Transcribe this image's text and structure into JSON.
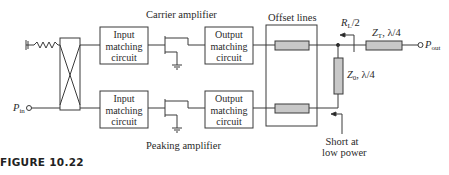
{
  "figure": {
    "caption": "FIGURE 10.22"
  },
  "blocks": {
    "input_matching_top": [
      "Input",
      "matching",
      "circuit"
    ],
    "input_matching_bottom": [
      "Input",
      "matching",
      "circuit"
    ],
    "output_matching_top": [
      "Output",
      "matching",
      "circuit"
    ],
    "output_matching_bottom": [
      "Output",
      "matching",
      "circuit"
    ]
  },
  "labels": {
    "carrier_amplifier": "Carrier amplifier",
    "peaking_amplifier": "Peaking amplifier",
    "offset_lines": "Offset lines",
    "rl_half": {
      "main": "R",
      "sub": "L",
      "rest": "/2"
    },
    "zt": {
      "main": "Z",
      "sub": "T",
      "rest": ", λ/4"
    },
    "z0": {
      "main": "Z",
      "sub": "0",
      "rest": ", λ/4"
    },
    "p_out": {
      "main": "P",
      "sub": "out"
    },
    "p_in": {
      "main": "P",
      "sub": "in"
    },
    "short_note": [
      "Short at",
      "low power"
    ]
  },
  "colors": {
    "line": "#3a3a3a",
    "tline_fill": "#c8c8c8",
    "background": "#ffffff"
  }
}
